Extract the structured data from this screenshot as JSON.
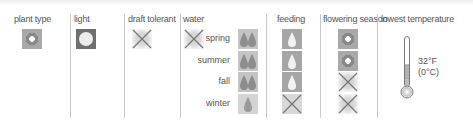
{
  "headers": {
    "plant_type": "plant type",
    "light": "light",
    "draft_tolerant": "draft tolerant",
    "water": "water",
    "feeding": "feeding",
    "flowering_season": "flowering season",
    "lowest_temperature": "lowest temperature"
  },
  "plant_type": {
    "icon": "flower-icon"
  },
  "light": {
    "icon": "full-sun-icon"
  },
  "draft_tolerant": {
    "icon": "x-mark-icon",
    "value": "no"
  },
  "water": {
    "icon": "x-mark-icon",
    "seasons": [
      {
        "label": "spring",
        "drops": 2
      },
      {
        "label": "summer",
        "drops": 2
      },
      {
        "label": "fall",
        "drops": 2
      },
      {
        "label": "winter",
        "drops": 1
      }
    ]
  },
  "feeding": {
    "seasons": [
      {
        "season": "spring",
        "value": "yes"
      },
      {
        "season": "summer",
        "value": "yes"
      },
      {
        "season": "fall",
        "value": "yes"
      },
      {
        "season": "winter",
        "value": "no"
      }
    ]
  },
  "flowering_season": {
    "seasons": [
      {
        "season": "spring",
        "value": "yes"
      },
      {
        "season": "summer",
        "value": "yes"
      },
      {
        "season": "fall",
        "value": "no"
      },
      {
        "season": "winter",
        "value": "no"
      }
    ]
  },
  "lowest_temperature": {
    "fahrenheit": "32°F",
    "celsius": "(0°C)"
  },
  "colors": {
    "icon_gray": "#a9a9a9",
    "icon_dark": "#6f6f6f",
    "drop_box": "#c4c4c4",
    "divider": "#c8c8c8"
  }
}
